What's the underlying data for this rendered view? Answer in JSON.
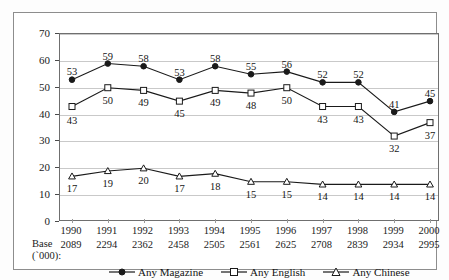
{
  "chart_data": {
    "type": "line",
    "title": "",
    "xlabel": "",
    "ylabel": "",
    "ylim": [
      0,
      70
    ],
    "yticks": [
      0,
      10,
      20,
      30,
      40,
      50,
      60,
      70
    ],
    "grid": true,
    "legend_position": "bottom",
    "categories": [
      "1990",
      "1991",
      "1992",
      "1993",
      "1994",
      "1995",
      "1996",
      "1997",
      "1998",
      "1999",
      "2000"
    ],
    "series": [
      {
        "name": "Any Magazine",
        "marker": "filled-circle",
        "values": [
          53,
          59,
          58,
          53,
          58,
          55,
          56,
          52,
          52,
          41,
          45
        ]
      },
      {
        "name": "Any English",
        "marker": "open-square",
        "values": [
          43,
          50,
          49,
          45,
          49,
          48,
          50,
          43,
          43,
          32,
          37
        ]
      },
      {
        "name": "Any Chinese",
        "marker": "open-triangle",
        "values": [
          17,
          19,
          20,
          17,
          18,
          15,
          15,
          14,
          14,
          14,
          14
        ]
      }
    ],
    "base_label_line1": "Base",
    "base_label_line2": "(`000):",
    "base_values": [
      2089,
      2294,
      2362,
      2458,
      2505,
      2561,
      2625,
      2708,
      2839,
      2934,
      2995
    ],
    "colors": {
      "line": "#1a1a1a",
      "grid": "#c9c9c9",
      "axis": "#6f6f6f",
      "text": "#161616",
      "background": "#ffffff"
    }
  }
}
